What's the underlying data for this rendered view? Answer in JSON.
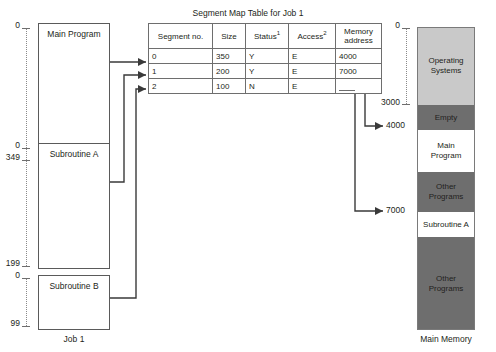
{
  "figure": {
    "left_caption": "Job 1",
    "right_caption": "Main Memory",
    "table_title": "Segment Map Table for Job 1"
  },
  "job_blocks": [
    {
      "name": "Main Program",
      "start": "0",
      "end": "349"
    },
    {
      "name": "Subroutine A",
      "start": "0",
      "end": "199"
    },
    {
      "name": "Subroutine B",
      "start": "0",
      "end": "99"
    }
  ],
  "table": {
    "headers": {
      "segment_no": "Segment no.",
      "size": "Size",
      "status": "Status",
      "status_sup": "1",
      "access": "Access",
      "access_sup": "2",
      "memory_address": "Memory\naddress"
    },
    "rows": [
      {
        "segment_no": "0",
        "size": "350",
        "status": "Y",
        "access": "E",
        "memory_address": "4000"
      },
      {
        "segment_no": "1",
        "size": "200",
        "status": "Y",
        "access": "E",
        "memory_address": "7000"
      },
      {
        "segment_no": "2",
        "size": "100",
        "status": "N",
        "access": "E",
        "memory_address": ""
      }
    ]
  },
  "memory": {
    "ticks": [
      "0",
      "3000",
      "4000",
      "7000"
    ],
    "blocks": [
      {
        "label": "Operating\nSystems",
        "color": "#c9c9c9"
      },
      {
        "label": "Empty",
        "color": "#6e6e6e"
      },
      {
        "label": "Main\nProgram",
        "color": "#ffffff"
      },
      {
        "label": "Other\nPrograms",
        "color": "#6e6e6e"
      },
      {
        "label": "Subroutine A",
        "color": "#ffffff"
      },
      {
        "label": "Other\nPrograms",
        "color": "#6e6e6e"
      }
    ]
  },
  "colors": {
    "line": "#3a3a3a",
    "border": "#6e6e6e",
    "gray_light": "#c9c9c9",
    "gray_dark": "#6e6e6e"
  }
}
